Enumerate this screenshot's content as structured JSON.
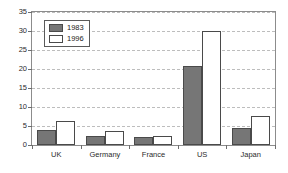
{
  "chart_data": {
    "type": "bar",
    "title": "",
    "subtitle": "",
    "xlabel": "",
    "ylabel": "",
    "categories": [
      "UK",
      "Germany",
      "France",
      "US",
      "Japan"
    ],
    "series": [
      {
        "name": "1983",
        "color": "#767676",
        "values": [
          4.0,
          2.4,
          2.0,
          20.8,
          4.4
        ]
      },
      {
        "name": "1996",
        "color": "#ffffff",
        "values": [
          6.3,
          3.8,
          2.5,
          30.0,
          7.6
        ]
      }
    ],
    "ylim": [
      0,
      35
    ],
    "ytick_values": [
      0,
      5,
      10,
      15,
      20,
      25,
      30,
      35
    ],
    "ytick_labels": [
      "0",
      "5",
      "10",
      "15",
      "20",
      "25",
      "30",
      "35"
    ],
    "grid": true,
    "grid_axis": "y",
    "grid_style": "dashed",
    "grid_color": "#bdbdbd",
    "legend_position": "upper-left-inside",
    "legend_entries": [
      "1983",
      "1996"
    ],
    "frame_color": "#8c8c8c",
    "bar_edge_color": "#4a4a4a",
    "background_color": "#ffffff"
  }
}
